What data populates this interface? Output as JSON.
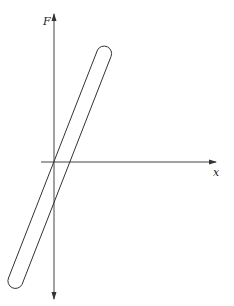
{
  "figure": {
    "type": "force-displacement loop",
    "axes": {
      "vertical_label": "F",
      "horizontal_label": "x"
    },
    "colors": {
      "stroke": "#333333",
      "background": "#ffffff"
    }
  }
}
